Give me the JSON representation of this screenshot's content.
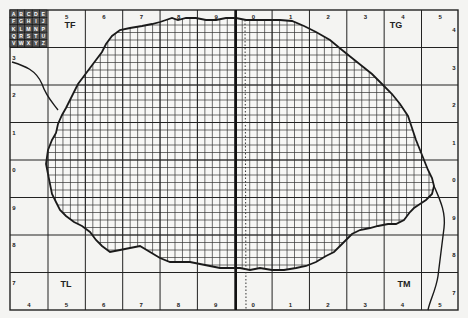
{
  "map": {
    "type": "grid_distribution_map",
    "region_labels": [
      {
        "text": "TF",
        "x": 70,
        "y": 28
      },
      {
        "text": "TG",
        "x": 396,
        "y": 28
      },
      {
        "text": "TL",
        "x": 66,
        "y": 287
      },
      {
        "text": "TM",
        "x": 404,
        "y": 287
      }
    ],
    "top_axis": [
      "5",
      "6",
      "7",
      "8",
      "9",
      "0",
      "1",
      "2",
      "3",
      "4",
      "5"
    ],
    "bottom_axis": [
      "4",
      "5",
      "6",
      "7",
      "8",
      "9",
      "0",
      "1",
      "2",
      "3",
      "4",
      "5"
    ],
    "left_axis": [
      "3",
      "2",
      "1",
      "0",
      "9",
      "8",
      "7"
    ],
    "right_axis": [
      "4",
      "3",
      "2",
      "1",
      "0",
      "9",
      "8",
      "7"
    ],
    "corner_labels": {
      "top_left_row": "4",
      "top_right": "4",
      "bottom_left": "7",
      "bottom_right": "7"
    },
    "key_grid": {
      "rows": [
        [
          "A",
          "B",
          "C",
          "D",
          "E"
        ],
        [
          "F",
          "G",
          "H",
          "I",
          "J"
        ],
        [
          "K",
          "L",
          "M",
          "N",
          "P"
        ],
        [
          "Q",
          "R",
          "S",
          "T",
          "U"
        ],
        [
          "V",
          "W",
          "X",
          "Y",
          "Z"
        ]
      ]
    },
    "colors": {
      "background": "#f4f4f2",
      "line": "#222222",
      "grid_fine": "#444444"
    }
  }
}
